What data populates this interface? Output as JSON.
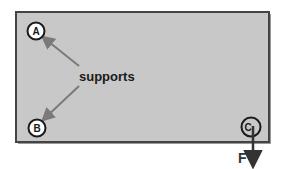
{
  "diagram": {
    "plate": {
      "fill": "#c8c8c8",
      "stroke": "#444444",
      "shadow": "#9a9a9a"
    },
    "supports_label": "supports",
    "nodes": [
      {
        "id": "A",
        "label": "A",
        "role": "support"
      },
      {
        "id": "B",
        "label": "B",
        "role": "support"
      },
      {
        "id": "C",
        "label": "C",
        "role": "load-point"
      }
    ],
    "force": {
      "label": "F",
      "direction": "down",
      "applied_at": "C"
    },
    "colors": {
      "arrow_gray": "#7a7a7a",
      "text": "#1a1a1a",
      "circle_fill": "#ffffff",
      "force_arrow": "#333333"
    }
  }
}
